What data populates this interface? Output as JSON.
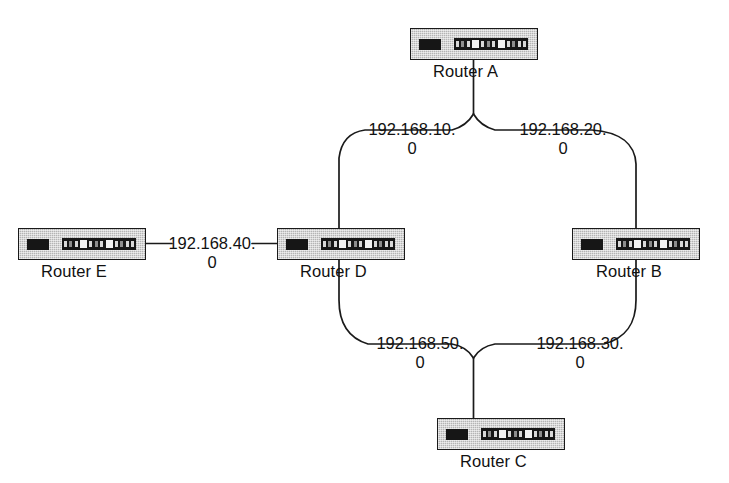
{
  "diagram": {
    "background_color": "#ffffff",
    "line_color": "#1a1a1a",
    "device_body_color": "#b4b4b4",
    "device_border_color": "#1a1a1a",
    "text_color": "#111111"
  },
  "devices": [
    {
      "id": "router-a",
      "label": "Router A",
      "icon": "router-icon",
      "x": 410,
      "y": 28
    },
    {
      "id": "router-e",
      "label": "Router E",
      "icon": "router-icon",
      "x": 18,
      "y": 228
    },
    {
      "id": "router-d",
      "label": "Router D",
      "icon": "router-icon",
      "x": 277,
      "y": 228
    },
    {
      "id": "router-b",
      "label": "Router B",
      "icon": "router-icon",
      "x": 572,
      "y": 228
    },
    {
      "id": "router-c",
      "label": "Router C",
      "icon": "router-icon",
      "x": 437,
      "y": 418
    }
  ],
  "networks": [
    {
      "id": "net-10",
      "line1": "192.168.10.",
      "line2": "0",
      "full": "192.168.10.0",
      "between": [
        "Router A",
        "Router D"
      ]
    },
    {
      "id": "net-20",
      "line1": "192.168.20.",
      "line2": "0",
      "full": "192.168.20.0",
      "between": [
        "Router A",
        "Router B"
      ]
    },
    {
      "id": "net-40",
      "line1": "192.168.40.",
      "line2": "0",
      "full": "192.168.40.0",
      "between": [
        "Router E",
        "Router D"
      ]
    },
    {
      "id": "net-50",
      "line1": "192.168.50.",
      "line2": "0",
      "full": "192.168.50.0",
      "between": [
        "Router D",
        "Router C"
      ]
    },
    {
      "id": "net-30",
      "line1": "192.168.30.",
      "line2": "0",
      "full": "192.168.30.0",
      "between": [
        "Router B",
        "Router C"
      ]
    }
  ]
}
